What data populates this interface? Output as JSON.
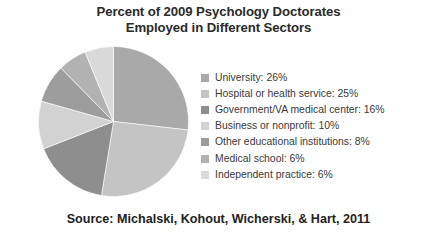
{
  "chart_data": {
    "type": "pie",
    "title": "Percent of 2009 Psychology Doctorates Employed in Different Sectors",
    "title_lines": [
      "Percent of 2009 Psychology Doctorates",
      "Employed in Different Sectors"
    ],
    "xlabel": "",
    "ylabel": "",
    "units": "percent",
    "start_angle_deg": 0,
    "direction": "clockwise",
    "legend_position": "right",
    "grid": false,
    "source": "Source: Michalski, Kohout, Wicherski, & Hart, 2011",
    "categories": [
      "University",
      "Hospital or health service",
      "Government/VA medical center",
      "Business or nonprofit",
      "Other educational institutions",
      "Medical school",
      "Independent practice"
    ],
    "values": [
      26,
      25,
      16,
      10,
      8,
      6,
      6
    ],
    "slices": [
      {
        "label": "University",
        "value": 26,
        "display": "University: 26%",
        "color": "#a9a9a9"
      },
      {
        "label": "Hospital or health service",
        "value": 25,
        "display": "Hospital or health service: 25%",
        "color": "#c4c4c4"
      },
      {
        "label": "Government/VA medical center",
        "value": 16,
        "display": "Government/VA medical center: 16%",
        "color": "#8e8e8e"
      },
      {
        "label": "Business or nonprofit",
        "value": 10,
        "display": "Business or nonprofit: 10%",
        "color": "#d2d2d2"
      },
      {
        "label": "Other educational institutions",
        "value": 8,
        "display": "Other educational institutions: 8%",
        "color": "#9d9d9d"
      },
      {
        "label": "Medical school",
        "value": 6,
        "display": "Medical school: 6%",
        "color": "#b2b2b2"
      },
      {
        "label": "Independent practice",
        "value": 6,
        "display": "Independent practice: 6%",
        "color": "#dadada"
      }
    ]
  },
  "legend": {
    "items": [
      {
        "text": "University: 26%",
        "color": "#a9a9a9"
      },
      {
        "text": "Hospital or health service: 25%",
        "color": "#c4c4c4"
      },
      {
        "text": "Government/VA medical center: 16%",
        "color": "#8e8e8e"
      },
      {
        "text": "Business or nonprofit: 10%",
        "color": "#d2d2d2"
      },
      {
        "text": "Other educational institutions: 8%",
        "color": "#9d9d9d"
      },
      {
        "text": "Medical school: 6%",
        "color": "#b2b2b2"
      },
      {
        "text": "Independent practice: 6%",
        "color": "#dadada"
      }
    ]
  },
  "figure": {
    "background": "#ffffff",
    "text_color": "#2b2b2b"
  }
}
